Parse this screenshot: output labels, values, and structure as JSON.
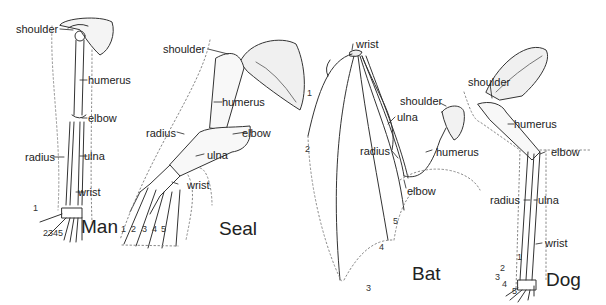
{
  "diagram": {
    "panels": [
      {
        "name": "Man",
        "labels": {
          "shoulder": "shoulder",
          "humerus": "humerus",
          "elbow": "elbow",
          "radius": "radius",
          "ulna": "ulna",
          "wrist": "wrist"
        },
        "digits": [
          "1",
          "2345"
        ]
      },
      {
        "name": "Seal",
        "labels": {
          "shoulder": "shoulder",
          "humerus": "humerus",
          "elbow": "elbow",
          "radius": "radius",
          "ulna": "ulna",
          "wrist": "wrist"
        },
        "digits": [
          "1",
          "2",
          "3",
          "4",
          "5"
        ]
      },
      {
        "name": "Bat",
        "labels": {
          "wrist": "wrist",
          "shoulder": "shoulder",
          "ulna": "ulna",
          "radius": "radius",
          "humerus": "humerus",
          "elbow": "elbow"
        },
        "digits": [
          "1",
          "2",
          "3",
          "4",
          "5"
        ]
      },
      {
        "name": "Dog",
        "labels": {
          "shoulder": "shoulder",
          "humerus": "humerus",
          "elbow": "elbow",
          "radius": "radius",
          "ulna": "ulna",
          "wrist": "wrist"
        },
        "digits": [
          "1",
          "2",
          "3",
          "4",
          "5"
        ]
      }
    ]
  }
}
